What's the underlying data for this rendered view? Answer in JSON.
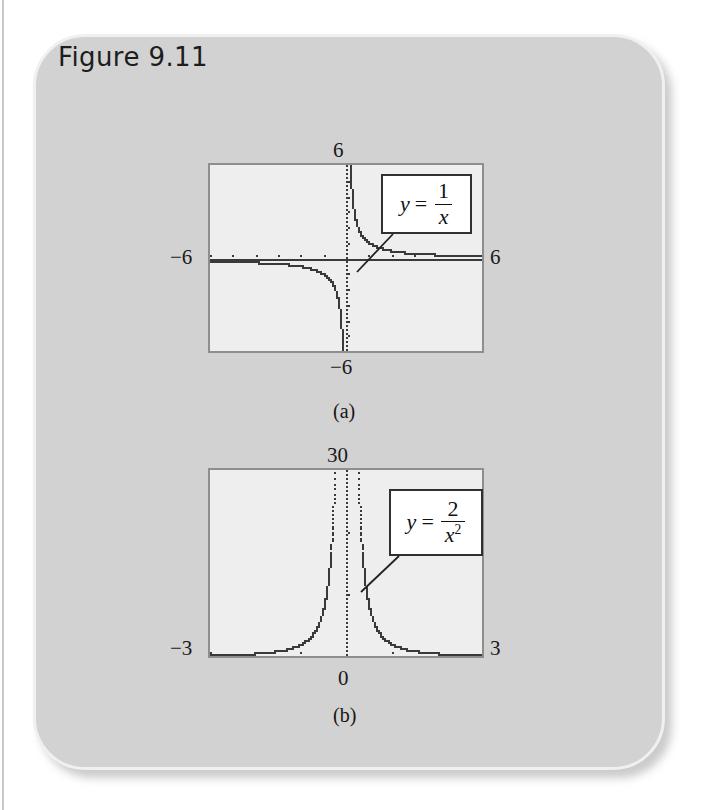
{
  "figure": {
    "title": "Figure 9.11",
    "card_color": "#d2d2d2",
    "plot_bg_color": "#eeeeee",
    "plot_border_color": "#8e8e8e",
    "curve_color": "#3a3a3a"
  },
  "panels": [
    {
      "caption": "(a)",
      "equation": {
        "lhs": "y",
        "eq": "=",
        "numerator": "1",
        "denominator": "x",
        "exponent": ""
      },
      "labels": {
        "top": "6",
        "left": "−6",
        "right": "6",
        "bottom": "−6"
      },
      "chart_data": {
        "type": "line",
        "title": "y = 1/x",
        "function": "y = 1/x",
        "xlabel": "x",
        "ylabel": "y",
        "xlim": [
          -6,
          6
        ],
        "ylim": [
          -6,
          6
        ],
        "xticks": [
          -6,
          6
        ],
        "yticks": [
          -6,
          6
        ],
        "tick_labels_x": [
          "−6",
          "6"
        ],
        "tick_labels_y": [
          "−6",
          "6"
        ],
        "grid": false,
        "legend": "none",
        "annotation": "y = 1/x",
        "branches": [
          {
            "name": "x<0",
            "x": [
              -6,
              -5,
              -4,
              -3,
              -2.5,
              -2,
              -1.5,
              -1,
              -0.8,
              -0.6,
              -0.4,
              -0.3,
              -0.2,
              -0.15
            ],
            "y": [
              -0.167,
              -0.2,
              -0.25,
              -0.333,
              -0.4,
              -0.5,
              -0.667,
              -1,
              -1.25,
              -1.667,
              -2.5,
              -3.333,
              -5,
              -6.667
            ]
          },
          {
            "name": "x>0",
            "x": [
              0.15,
              0.2,
              0.3,
              0.4,
              0.6,
              0.8,
              1,
              1.5,
              2,
              2.5,
              3,
              4,
              5,
              6
            ],
            "y": [
              6.667,
              5,
              3.333,
              2.5,
              1.667,
              1.25,
              1,
              0.667,
              0.5,
              0.4,
              0.333,
              0.25,
              0.2,
              0.167
            ]
          }
        ],
        "asymptotes": {
          "vertical": [
            0
          ],
          "horizontal": [
            0
          ]
        }
      }
    },
    {
      "caption": "(b)",
      "equation": {
        "lhs": "y",
        "eq": "=",
        "numerator": "2",
        "denominator": "x",
        "exponent": "2"
      },
      "labels": {
        "top": "30",
        "left": "−3",
        "right": "3",
        "bottom": "0"
      },
      "chart_data": {
        "type": "line",
        "title": "y = 2/x²",
        "function": "y = 2/x^2",
        "xlabel": "x",
        "ylabel": "y",
        "xlim": [
          -3,
          3
        ],
        "ylim": [
          0,
          30
        ],
        "xticks": [
          -3,
          0,
          3
        ],
        "yticks": [
          0,
          30
        ],
        "tick_labels_x": [
          "−3",
          "0",
          "3"
        ],
        "tick_labels_y": [
          "0",
          "30"
        ],
        "grid": false,
        "legend": "none",
        "annotation": "y = 2/x²",
        "branches": [
          {
            "name": "x<0",
            "x": [
              -3,
              -2.5,
              -2,
              -1.6,
              -1.2,
              -1,
              -0.8,
              -0.6,
              -0.5,
              -0.4,
              -0.32,
              -0.27
            ],
            "y": [
              0.222,
              0.32,
              0.5,
              0.781,
              1.389,
              2,
              3.125,
              5.556,
              8,
              12.5,
              19.5,
              27.4
            ]
          },
          {
            "name": "x>0",
            "x": [
              0.27,
              0.32,
              0.4,
              0.5,
              0.6,
              0.8,
              1,
              1.2,
              1.6,
              2,
              2.5,
              3
            ],
            "y": [
              27.4,
              19.5,
              12.5,
              8,
              5.556,
              3.125,
              2,
              1.389,
              0.781,
              0.5,
              0.32,
              0.222
            ]
          }
        ],
        "asymptotes": {
          "vertical": [
            0
          ],
          "horizontal": [
            0
          ]
        }
      }
    }
  ]
}
